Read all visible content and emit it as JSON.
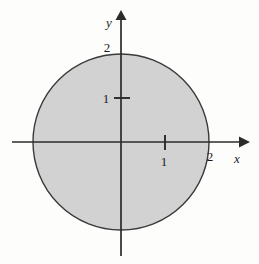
{
  "figure": {
    "caption_title": "Disk of radius 2 centered at the origin",
    "background_color": "#fdfdfc"
  },
  "axes": {
    "x_label": "x",
    "y_label": "y",
    "x_label_name": "x-axis-label",
    "y_label_name": "y-axis-label",
    "axis_color": "#2b2b2b",
    "origin_px": {
      "x": 121,
      "y": 142
    },
    "units_per_pixel": 44,
    "x_axis_start_px": 12,
    "x_axis_end_px": 248,
    "y_axis_top_px": 11,
    "y_axis_bottom_px": 256
  },
  "ticks": {
    "x": [
      {
        "value": "1",
        "pos": 1,
        "has_mark": true
      },
      {
        "value": "2",
        "pos": 2,
        "has_mark": false
      }
    ],
    "y": [
      {
        "value": "1",
        "pos": 1,
        "has_mark": true
      },
      {
        "value": "2",
        "pos": 2,
        "has_mark": false
      }
    ]
  },
  "shape": {
    "type": "circle",
    "center": [
      0,
      0
    ],
    "radius": 2,
    "fill_color": "#d2d2d2",
    "stroke_color": "#3a3a3a",
    "stroke_width": 1.4,
    "name": "shaded-disk"
  },
  "chart_data": {
    "type": "scatter",
    "xlabel": "x",
    "ylabel": "y",
    "xlim": [
      -2.5,
      2.9
    ],
    "ylim": [
      -2.6,
      3.0
    ],
    "grid": false,
    "legend": null,
    "xticks": [
      1,
      2
    ],
    "xticklabels": [
      "1",
      "2"
    ],
    "yticks": [
      1,
      2
    ],
    "yticklabels": [
      "1",
      "2"
    ],
    "shapes": [
      {
        "kind": "circle",
        "center": [
          0,
          0
        ],
        "radius": 2,
        "filled": true,
        "fill": "#d2d2d2",
        "edge": "#3a3a3a",
        "annotation": "x^2 + y^2 <= 4"
      }
    ]
  }
}
